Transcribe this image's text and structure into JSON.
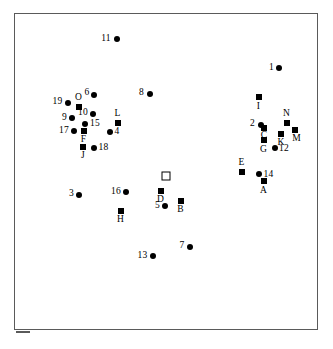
{
  "figure": {
    "type": "scatter-plot",
    "background_color": "#ffffff",
    "frame_color": "#5a5a5a",
    "marker_color": "#000000"
  },
  "chart_data": {
    "type": "scatter",
    "title": "",
    "subtitle": "",
    "xlabel": "",
    "ylabel": "",
    "xlim": [
      0,
      100
    ],
    "ylim": [
      0,
      100
    ],
    "grid": false,
    "axis_ticks": false,
    "legend": null,
    "legend_position": "none",
    "marker_legend": [
      {
        "marker": "filled-circle",
        "meaning": "numbered point"
      },
      {
        "marker": "filled-square",
        "meaning": "lettered point"
      },
      {
        "marker": "open-square",
        "meaning": "unlabeled reference point"
      }
    ],
    "series": [
      {
        "name": "Numbered points",
        "marker": "filled-circle",
        "points": [
          {
            "label": "11",
            "x": 35.2,
            "y": 90.9,
            "label_pos": "left"
          },
          {
            "label": "1",
            "x": 88.8,
            "y": 81.7,
            "label_pos": "left"
          },
          {
            "label": "6",
            "x": 29.0,
            "y": 73.2,
            "label_pos": "left"
          },
          {
            "label": "8",
            "x": 47.5,
            "y": 73.5,
            "label_pos": "left"
          },
          {
            "label": "19",
            "x": 20.4,
            "y": 70.7,
            "label_pos": "left"
          },
          {
            "label": "10",
            "x": 28.5,
            "y": 65.5,
            "label_pos": "left"
          },
          {
            "label": "9",
            "x": 21.7,
            "y": 64.3,
            "label_pos": "left"
          },
          {
            "label": "15",
            "x": 26.0,
            "y": 61.0,
            "label_pos": "right"
          },
          {
            "label": "17",
            "x": 22.3,
            "y": 58.7,
            "label_pos": "left"
          },
          {
            "label": "4",
            "x": 34.3,
            "y": 58.5,
            "label_pos": "right"
          },
          {
            "label": "2",
            "x": 80.4,
            "y": 62.4,
            "label_pos": "left"
          },
          {
            "label": "12",
            "x": 86.2,
            "y": 51.4,
            "label_pos": "right"
          },
          {
            "label": "18",
            "x": 28.8,
            "y": 51.5,
            "label_pos": "right"
          },
          {
            "label": "14",
            "x": 81.8,
            "y": 44.7,
            "label_pos": "right"
          },
          {
            "label": "16",
            "x": 38.8,
            "y": 37.8,
            "label_pos": "left"
          },
          {
            "label": "3",
            "x": 24.1,
            "y": 37.0,
            "label_pos": "left"
          },
          {
            "label": "5",
            "x": 52.3,
            "y": 33.6,
            "label_pos": "left"
          },
          {
            "label": "7",
            "x": 59.4,
            "y": 21.3,
            "label_pos": "left"
          },
          {
            "label": "13",
            "x": 45.8,
            "y": 18.1,
            "label_pos": "left"
          }
        ]
      },
      {
        "name": "Lettered points",
        "marker": "filled-square",
        "points": [
          {
            "label": "I",
            "x": 79.8,
            "y": 69.5,
            "label_pos": "below"
          },
          {
            "label": "O",
            "x": 23.4,
            "y": 69.6,
            "label_pos": "above"
          },
          {
            "label": "L",
            "x": 35.8,
            "y": 62.8,
            "label_pos": "above"
          },
          {
            "label": "N",
            "x": 89.0,
            "y": 61.2,
            "label_pos": "above"
          },
          {
            "label": "C",
            "x": 81.2,
            "y": 60.3,
            "label_pos": "below"
          },
          {
            "label": "M",
            "x": 91.6,
            "y": 57.9,
            "label_pos": "below-right"
          },
          {
            "label": "K",
            "x": 87.2,
            "y": 56.8,
            "label_pos": "below"
          },
          {
            "label": "F",
            "x": 25.6,
            "y": 58.0,
            "label_pos": "below"
          },
          {
            "label": "G",
            "x": 81.0,
            "y": 53.9,
            "label_pos": "below"
          },
          {
            "label": "J",
            "x": 25.4,
            "y": 52.0,
            "label_pos": "below"
          },
          {
            "label": "E",
            "x": 76.0,
            "y": 45.8,
            "label_pos": "above"
          },
          {
            "label": "A",
            "x": 81.8,
            "y": 41.6,
            "label_pos": "below"
          },
          {
            "label": "D",
            "x": 51.3,
            "y": 37.5,
            "label_pos": "below"
          },
          {
            "label": "B",
            "x": 57.8,
            "y": 34.7,
            "label_pos": "below"
          },
          {
            "label": "H",
            "x": 37.6,
            "y": 31.8,
            "label_pos": "below"
          }
        ]
      },
      {
        "name": "Reference point",
        "marker": "open-square",
        "points": [
          {
            "label": "",
            "x": 53.6,
            "y": 43.0,
            "label_pos": "none"
          }
        ]
      }
    ]
  },
  "points": [
    {
      "name": "point-11",
      "label": "11",
      "marker": "circle",
      "cx": 115.5,
      "cy": 38.0,
      "lx": 105.0,
      "ly": 38.0
    },
    {
      "name": "point-1",
      "label": "1",
      "marker": "circle",
      "cx": 278.0,
      "cy": 67.0,
      "lx": 270.5,
      "ly": 67.0
    },
    {
      "name": "point-6",
      "label": "6",
      "marker": "circle",
      "cx": 93.0,
      "cy": 93.5,
      "lx": 86.0,
      "ly": 92.0
    },
    {
      "name": "point-8",
      "label": "8",
      "marker": "circle",
      "cx": 149.0,
      "cy": 92.5,
      "lx": 140.5,
      "ly": 91.5
    },
    {
      "name": "point-19",
      "label": "19",
      "marker": "circle",
      "cx": 67.0,
      "cy": 101.5,
      "lx": 56.5,
      "ly": 101.0
    },
    {
      "name": "point-O",
      "label": "O",
      "marker": "square-filled",
      "cx": 77.5,
      "cy": 105.5,
      "lx": 77.5,
      "ly": 96.5
    },
    {
      "name": "point-10",
      "label": "10",
      "marker": "circle",
      "cx": 92.0,
      "cy": 113.0,
      "lx": 82.0,
      "ly": 112.0
    },
    {
      "name": "point-9",
      "label": "9",
      "marker": "circle",
      "cx": 71.0,
      "cy": 117.0,
      "lx": 63.5,
      "ly": 116.5
    },
    {
      "name": "point-L",
      "label": "L",
      "marker": "square-filled",
      "cx": 116.5,
      "cy": 121.5,
      "lx": 116.5,
      "ly": 112.5
    },
    {
      "name": "point-15",
      "label": "15",
      "marker": "circle",
      "cx": 84.0,
      "cy": 122.5,
      "lx": 94.0,
      "ly": 123.0
    },
    {
      "name": "point-17",
      "label": "17",
      "marker": "circle",
      "cx": 72.5,
      "cy": 130.0,
      "lx": 63.0,
      "ly": 130.0
    },
    {
      "name": "point-4",
      "label": "4",
      "marker": "circle",
      "cx": 109.0,
      "cy": 130.5,
      "lx": 116.0,
      "ly": 131.0
    },
    {
      "name": "point-I",
      "label": "I",
      "marker": "square-filled",
      "cx": 257.5,
      "cy": 96.0,
      "lx": 257.5,
      "ly": 106.0
    },
    {
      "name": "point-2",
      "label": "2",
      "marker": "circle",
      "cx": 259.5,
      "cy": 123.5,
      "lx": 251.5,
      "ly": 123.0
    },
    {
      "name": "point-N",
      "label": "N",
      "marker": "square-filled",
      "cx": 285.5,
      "cy": 121.5,
      "lx": 285.5,
      "ly": 112.5
    },
    {
      "name": "point-C",
      "label": "C",
      "marker": "square-filled",
      "cx": 263.0,
      "cy": 126.5,
      "lx": 263.0,
      "ly": 135.0
    },
    {
      "name": "point-M",
      "label": "M",
      "marker": "square-filled",
      "cx": 293.5,
      "cy": 129.0,
      "lx": 295.5,
      "ly": 138.0
    },
    {
      "name": "point-K",
      "label": "K",
      "marker": "square-filled",
      "cx": 280.0,
      "cy": 132.5,
      "lx": 280.0,
      "ly": 142.0
    },
    {
      "name": "point-F",
      "label": "F",
      "marker": "square-filled",
      "cx": 82.5,
      "cy": 129.5,
      "lx": 82.5,
      "ly": 139.0
    },
    {
      "name": "point-G",
      "label": "G",
      "marker": "square-filled",
      "cx": 262.5,
      "cy": 139.0,
      "lx": 262.5,
      "ly": 148.5
    },
    {
      "name": "point-12",
      "label": "12",
      "marker": "circle",
      "cx": 274.0,
      "cy": 147.0,
      "lx": 283.0,
      "ly": 147.5
    },
    {
      "name": "point-J",
      "label": "J",
      "marker": "square-filled",
      "cx": 82.0,
      "cy": 145.5,
      "lx": 82.0,
      "ly": 155.0
    },
    {
      "name": "point-18",
      "label": "18",
      "marker": "circle",
      "cx": 92.5,
      "cy": 146.5,
      "lx": 102.5,
      "ly": 147.0
    },
    {
      "name": "point-E",
      "label": "E",
      "marker": "square-filled",
      "cx": 240.5,
      "cy": 171.0,
      "lx": 240.5,
      "ly": 161.5
    },
    {
      "name": "point-open-square",
      "label": "",
      "marker": "square-open",
      "cx": 164.5,
      "cy": 175.0,
      "lx": 0,
      "ly": 0
    },
    {
      "name": "point-14",
      "label": "14",
      "marker": "circle",
      "cx": 258.0,
      "cy": 173.0,
      "lx": 267.5,
      "ly": 173.5
    },
    {
      "name": "point-A",
      "label": "A",
      "marker": "square-filled",
      "cx": 262.5,
      "cy": 180.0,
      "lx": 262.5,
      "ly": 189.5
    },
    {
      "name": "point-D",
      "label": "D",
      "marker": "square-filled",
      "cx": 159.5,
      "cy": 190.0,
      "lx": 159.5,
      "ly": 199.0
    },
    {
      "name": "point-16",
      "label": "16",
      "marker": "circle",
      "cx": 125.0,
      "cy": 191.0,
      "lx": 115.0,
      "ly": 191.0
    },
    {
      "name": "point-3",
      "label": "3",
      "marker": "circle",
      "cx": 78.0,
      "cy": 193.5,
      "lx": 70.5,
      "ly": 193.0
    },
    {
      "name": "point-B",
      "label": "B",
      "marker": "square-filled",
      "cx": 179.5,
      "cy": 199.5,
      "lx": 179.5,
      "ly": 209.0
    },
    {
      "name": "point-5",
      "label": "5",
      "marker": "circle",
      "cx": 164.0,
      "cy": 204.5,
      "lx": 156.5,
      "ly": 204.5
    },
    {
      "name": "point-H",
      "label": "H",
      "marker": "square-filled",
      "cx": 119.5,
      "cy": 209.5,
      "lx": 119.5,
      "ly": 219.0
    },
    {
      "name": "point-7",
      "label": "7",
      "marker": "circle",
      "cx": 189.0,
      "cy": 245.5,
      "lx": 181.0,
      "ly": 245.0
    },
    {
      "name": "point-13",
      "label": "13",
      "marker": "circle",
      "cx": 152.0,
      "cy": 255.0,
      "lx": 141.5,
      "ly": 255.0
    }
  ]
}
